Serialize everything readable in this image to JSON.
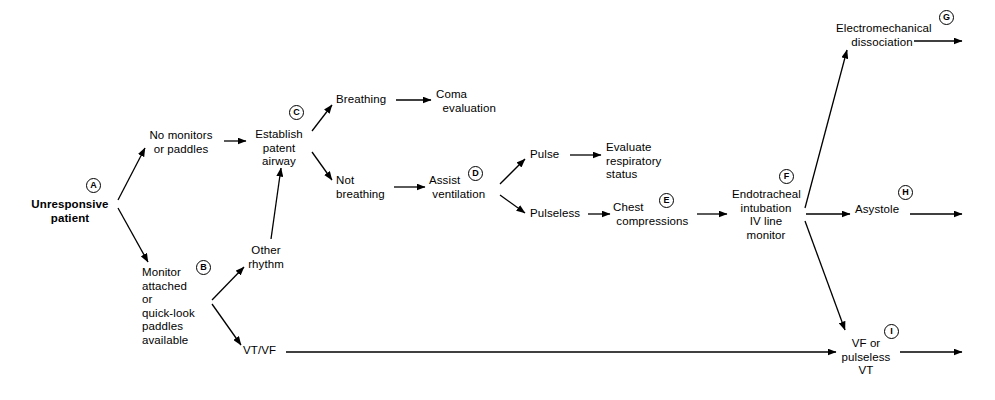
{
  "diagram": {
    "background_color": "#ffffff",
    "line_color": "#000000",
    "text_color": "#000000"
  },
  "nodes": [
    {
      "id": "unresponsive_patient",
      "label": "Unresponsive\npatient",
      "x": 27,
      "y": 198,
      "w": 86,
      "align": "center",
      "bold": true
    },
    {
      "id": "no_monitors",
      "label": "No monitors\nor paddles",
      "x": 142,
      "y": 129,
      "w": 78,
      "align": "center",
      "bold": false
    },
    {
      "id": "monitor_attached",
      "label": "Monitor\nattached\nor\nquick-look\npaddles\navailable",
      "x": 142,
      "y": 266,
      "w": 66,
      "align": "left",
      "bold": false
    },
    {
      "id": "establish_airway",
      "label": "Establish\npatent\nairway",
      "x": 251,
      "y": 128,
      "w": 56,
      "align": "center",
      "bold": false
    },
    {
      "id": "other_rhythm",
      "label": "Other\nrhythm",
      "x": 245,
      "y": 244,
      "w": 42,
      "align": "center",
      "bold": false
    },
    {
      "id": "vt_vf",
      "label": "VT/VF",
      "x": 243,
      "y": 344,
      "w": 38,
      "align": "left",
      "bold": false
    },
    {
      "id": "breathing",
      "label": "Breathing",
      "x": 336,
      "y": 93,
      "w": 54,
      "align": "left",
      "bold": false
    },
    {
      "id": "not_breathing",
      "label": "Not\nbreathing",
      "x": 336,
      "y": 174,
      "w": 52,
      "align": "left",
      "bold": false
    },
    {
      "id": "coma_evaluation",
      "label": "Coma\n  evaluation",
      "x": 436,
      "y": 88,
      "w": 68,
      "align": "left",
      "bold": false
    },
    {
      "id": "assist_ventilation",
      "label": "Assist\n ventilation",
      "x": 429,
      "y": 174,
      "w": 62,
      "align": "left",
      "bold": false
    },
    {
      "id": "pulse",
      "label": "Pulse",
      "x": 530,
      "y": 148,
      "w": 34,
      "align": "left",
      "bold": false
    },
    {
      "id": "pulseless",
      "label": "Pulseless",
      "x": 530,
      "y": 207,
      "w": 52,
      "align": "left",
      "bold": false
    },
    {
      "id": "evaluate_respiratory",
      "label": "Evaluate\nrespiratory\nstatus",
      "x": 606,
      "y": 141,
      "w": 63,
      "align": "left",
      "bold": false
    },
    {
      "id": "chest_compressions",
      "label": "Chest\n compressions",
      "x": 613,
      "y": 201,
      "w": 76,
      "align": "left",
      "bold": false
    },
    {
      "id": "endotracheal_intubation",
      "label": "Endotracheal\nintubation\nIV line\nmonitor",
      "x": 732,
      "y": 188,
      "w": 68,
      "align": "center",
      "bold": false
    },
    {
      "id": "electromechanical",
      "label": "Electromechanical\ndissociation",
      "x": 836,
      "y": 22,
      "w": 92,
      "align": "center",
      "bold": false
    },
    {
      "id": "asystole",
      "label": "Asystole",
      "x": 855,
      "y": 203,
      "w": 48,
      "align": "left",
      "bold": false
    },
    {
      "id": "vf_pulseless_vt",
      "label": "VF or\npulseless\nVT",
      "x": 839,
      "y": 337,
      "w": 54,
      "align": "center",
      "bold": false
    }
  ],
  "markers": [
    {
      "id": "marker_a",
      "letter": "A",
      "x": 86,
      "y": 178
    },
    {
      "id": "marker_b",
      "letter": "B",
      "x": 196,
      "y": 260
    },
    {
      "id": "marker_c",
      "letter": "C",
      "x": 289,
      "y": 105
    },
    {
      "id": "marker_d",
      "letter": "D",
      "x": 468,
      "y": 166
    },
    {
      "id": "marker_e",
      "letter": "E",
      "x": 659,
      "y": 193
    },
    {
      "id": "marker_f",
      "letter": "F",
      "x": 779,
      "y": 169
    },
    {
      "id": "marker_g",
      "letter": "G",
      "x": 939,
      "y": 10
    },
    {
      "id": "marker_h",
      "letter": "H",
      "x": 898,
      "y": 185
    },
    {
      "id": "marker_i",
      "letter": "I",
      "x": 884,
      "y": 324
    }
  ],
  "edges": [
    {
      "id": "edge-patient-to-no-monitors",
      "from": "unresponsive_patient",
      "to": "no_monitors",
      "x1": 118,
      "y1": 200,
      "x2": 145,
      "y2": 148
    },
    {
      "id": "edge-patient-to-monitor",
      "from": "unresponsive_patient",
      "to": "monitor_attached",
      "x1": 118,
      "y1": 208,
      "x2": 148,
      "y2": 262
    },
    {
      "id": "edge-no-monitors-to-airway",
      "from": "no_monitors",
      "to": "establish_airway",
      "x1": 224,
      "y1": 141,
      "x2": 246,
      "y2": 141
    },
    {
      "id": "edge-monitor-to-other-rhythm",
      "from": "monitor_attached",
      "to": "other_rhythm",
      "x1": 212,
      "y1": 300,
      "x2": 244,
      "y2": 267
    },
    {
      "id": "edge-monitor-to-vt-vf",
      "from": "monitor_attached",
      "to": "vt_vf",
      "x1": 212,
      "y1": 304,
      "x2": 241,
      "y2": 345
    },
    {
      "id": "edge-other-rhythm-to-airway",
      "from": "other_rhythm",
      "to": "establish_airway",
      "x1": 271,
      "y1": 239,
      "x2": 281,
      "y2": 168
    },
    {
      "id": "edge-airway-to-breathing",
      "from": "establish_airway",
      "to": "breathing",
      "x1": 312,
      "y1": 131,
      "x2": 332,
      "y2": 105
    },
    {
      "id": "edge-airway-to-not-breathing",
      "from": "establish_airway",
      "to": "not_breathing",
      "x1": 312,
      "y1": 152,
      "x2": 332,
      "y2": 180
    },
    {
      "id": "edge-breathing-to-coma",
      "from": "breathing",
      "to": "coma_evaluation",
      "x1": 396,
      "y1": 100,
      "x2": 431,
      "y2": 100
    },
    {
      "id": "edge-not-breathing-to-assist",
      "from": "not_breathing",
      "to": "assist_ventilation",
      "x1": 394,
      "y1": 187,
      "x2": 425,
      "y2": 187
    },
    {
      "id": "edge-assist-to-pulse",
      "from": "assist_ventilation",
      "to": "pulse",
      "x1": 500,
      "y1": 184,
      "x2": 525,
      "y2": 159
    },
    {
      "id": "edge-assist-to-pulseless",
      "from": "assist_ventilation",
      "to": "pulseless",
      "x1": 500,
      "y1": 195,
      "x2": 525,
      "y2": 213
    },
    {
      "id": "edge-pulse-to-evaluate",
      "from": "pulse",
      "to": "evaluate_respiratory",
      "x1": 570,
      "y1": 155,
      "x2": 601,
      "y2": 155
    },
    {
      "id": "edge-pulseless-to-chest",
      "from": "pulseless",
      "to": "chest_compressions",
      "x1": 588,
      "y1": 214,
      "x2": 610,
      "y2": 214
    },
    {
      "id": "edge-chest-to-endotracheal",
      "from": "chest_compressions",
      "to": "endotracheal_intubation",
      "x1": 697,
      "y1": 214,
      "x2": 727,
      "y2": 214
    },
    {
      "id": "edge-endotracheal-to-electromech",
      "from": "endotracheal_intubation",
      "to": "electromechanical",
      "x1": 805,
      "y1": 208,
      "x2": 847,
      "y2": 50
    },
    {
      "id": "edge-endotracheal-to-asystole",
      "from": "endotracheal_intubation",
      "to": "asystole",
      "x1": 806,
      "y1": 214,
      "x2": 850,
      "y2": 214
    },
    {
      "id": "edge-endotracheal-to-vf",
      "from": "endotracheal_intubation",
      "to": "vf_pulseless_vt",
      "x1": 805,
      "y1": 221,
      "x2": 845,
      "y2": 330
    },
    {
      "id": "edge-vt-vf-to-vf-pulseless",
      "from": "vt_vf",
      "to": "vf_pulseless_vt",
      "x1": 286,
      "y1": 352,
      "x2": 836,
      "y2": 352
    },
    {
      "id": "edge-electromech-exit",
      "from": "electromechanical",
      "to": "exit-g",
      "x1": 914,
      "y1": 41,
      "x2": 962,
      "y2": 41
    },
    {
      "id": "edge-asystole-exit",
      "from": "asystole",
      "to": "exit-h",
      "x1": 910,
      "y1": 214,
      "x2": 962,
      "y2": 214
    },
    {
      "id": "edge-vf-exit",
      "from": "vf_pulseless_vt",
      "to": "exit-i",
      "x1": 900,
      "y1": 352,
      "x2": 962,
      "y2": 352
    }
  ]
}
